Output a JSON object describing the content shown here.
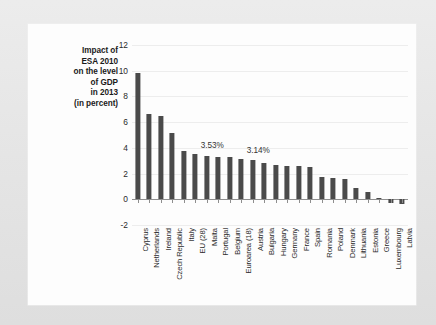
{
  "figure": {
    "y_axis_title_lines": [
      "Impact of",
      "ESA 2010",
      "on the level",
      "of GDP",
      "in 2013",
      "(in percent)"
    ]
  },
  "chart_data": {
    "type": "bar",
    "title": "",
    "subtitle": "",
    "xlabel": "",
    "ylabel": "Impact of ESA 2010 on the level of GDP in 2013 (in percent)",
    "ylim": [
      -2,
      12
    ],
    "yticks": [
      12,
      10,
      8,
      6,
      4,
      2,
      0,
      -2
    ],
    "ytick_labels": [
      "12",
      "10",
      "8",
      "6",
      "4",
      "2",
      "0",
      "-2"
    ],
    "grid": true,
    "grid_axis": "y",
    "legend": false,
    "bar_color": "#4a4a4a",
    "categories": [
      "Cyprus",
      "Netherlands",
      "Ireland",
      "Czech Republic",
      "Italy",
      "EU (28)",
      "Malta",
      "Portugal",
      "Belgium",
      "Euroarea (18)",
      "Austria",
      "Bulgaria",
      "Hungary",
      "Germany",
      "France",
      "Spain",
      "Romania",
      "Poland",
      "Denmark",
      "Lithuania",
      "Estonia",
      "Greece",
      "Luxembourg",
      "Latvia"
    ],
    "values": [
      9.8,
      6.65,
      6.5,
      5.15,
      3.75,
      3.53,
      3.35,
      3.3,
      3.3,
      3.14,
      3.05,
      2.8,
      2.65,
      2.6,
      2.6,
      2.5,
      1.7,
      1.65,
      1.55,
      0.9,
      0.6,
      0.1,
      -0.3,
      -0.35
    ],
    "annotations": [
      {
        "label": "3.53%",
        "category": "EU (28)",
        "value": 3.53
      },
      {
        "label": "3.14%",
        "category": "Euroarea (18)",
        "value": 3.14
      }
    ]
  }
}
